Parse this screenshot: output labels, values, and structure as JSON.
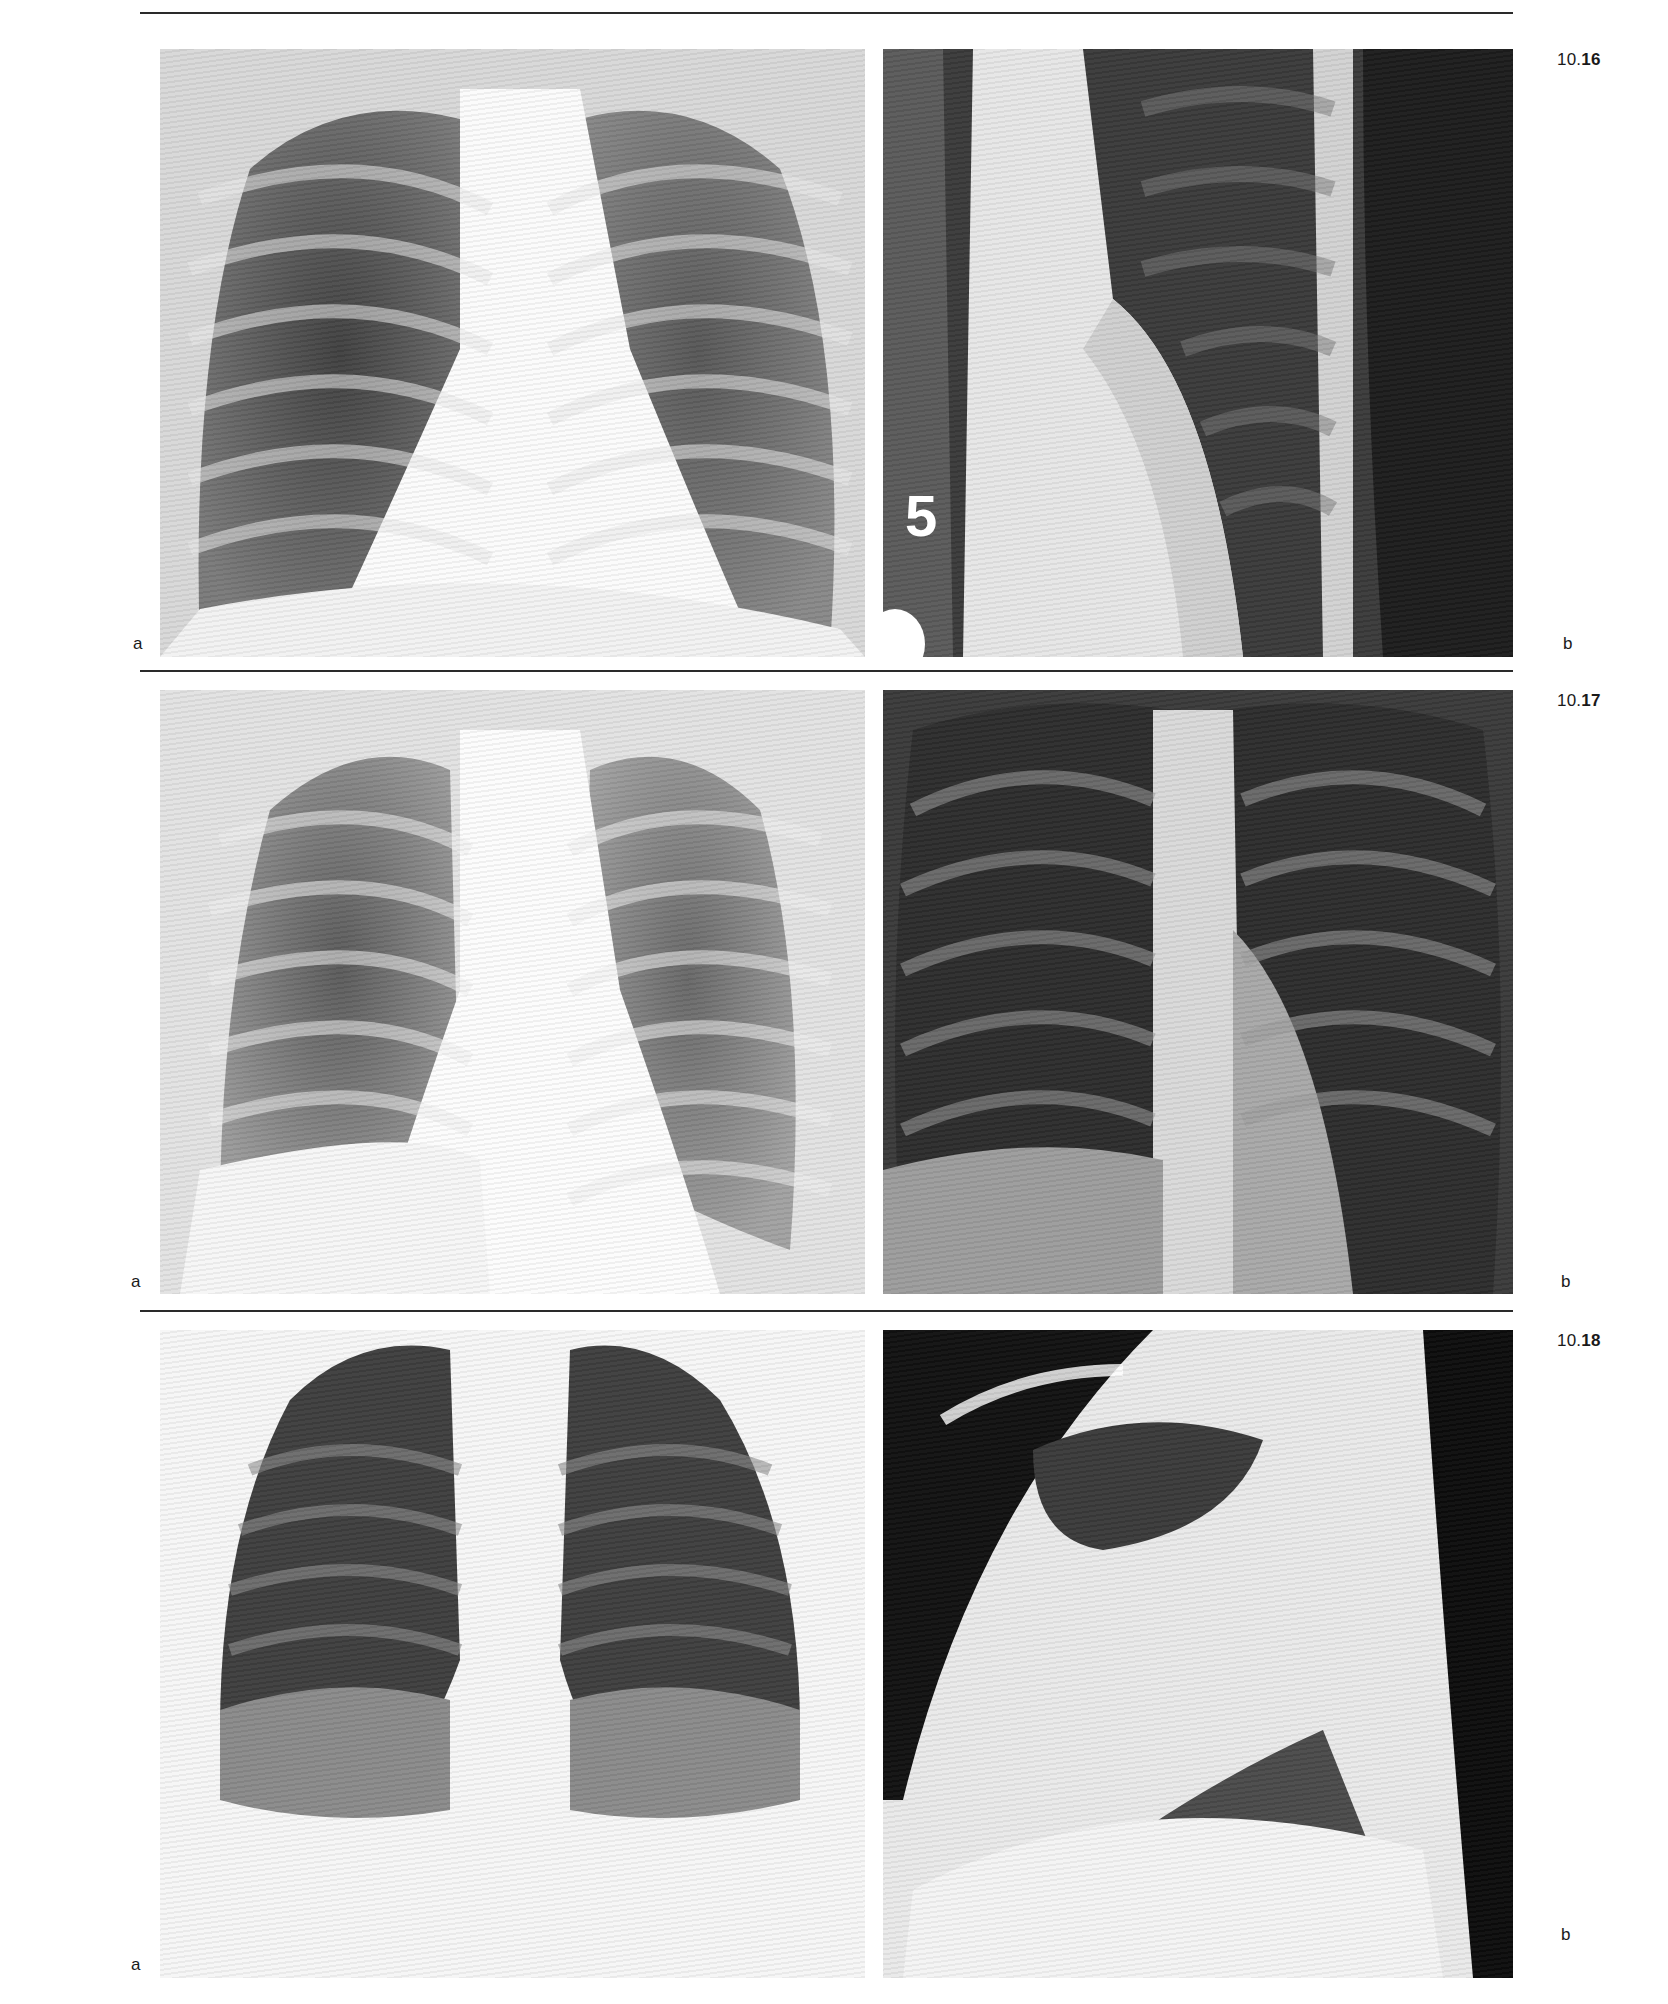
{
  "page": {
    "top_rule": true,
    "figures": [
      {
        "number_prefix": "10.",
        "number_bold": "16",
        "panels": [
          {
            "label": "a",
            "description": "frontal chest radiograph"
          },
          {
            "label": "b",
            "description": "oblique / lateral chest radiograph with film markers",
            "markers": [
              "5"
            ]
          }
        ]
      },
      {
        "number_prefix": "10.",
        "number_bold": "17",
        "panels": [
          {
            "label": "a",
            "description": "frontal chest radiograph"
          },
          {
            "label": "b",
            "description": "frontal chest radiograph, high contrast"
          }
        ]
      },
      {
        "number_prefix": "10.",
        "number_bold": "18",
        "panels": [
          {
            "label": "a",
            "description": "frontal chest radiograph"
          },
          {
            "label": "b",
            "description": "lateral chest radiograph"
          }
        ]
      }
    ]
  }
}
